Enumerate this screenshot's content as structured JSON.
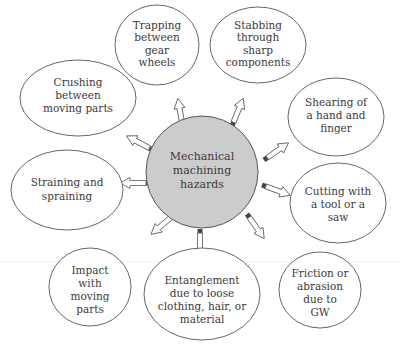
{
  "diagram": {
    "center": {
      "lines": [
        "Mechanical",
        "machining",
        "hazards"
      ]
    },
    "nodes": [
      {
        "id": "trapping",
        "lines": [
          "Trapping",
          "between",
          "gear",
          "wheels"
        ]
      },
      {
        "id": "stabbing",
        "lines": [
          "Stabbing",
          "through",
          "sharp",
          "components"
        ]
      },
      {
        "id": "crushing",
        "lines": [
          "Crushing",
          "between",
          "moving parts"
        ]
      },
      {
        "id": "shearing",
        "lines": [
          "Shearing of",
          "a hand and",
          "finger"
        ]
      },
      {
        "id": "straining",
        "lines": [
          "Straining and",
          "spraining"
        ]
      },
      {
        "id": "cutting",
        "lines": [
          "Cutting with",
          "a tool or a",
          "saw"
        ]
      },
      {
        "id": "impact",
        "lines": [
          "Impact",
          "with",
          "moving",
          "parts"
        ]
      },
      {
        "id": "entanglement",
        "lines": [
          "Entanglement",
          "due to loose",
          "clothing, hair, or",
          "material"
        ]
      },
      {
        "id": "friction",
        "lines": [
          "Friction or",
          "abrasion",
          "due to",
          "GW"
        ]
      }
    ],
    "colors": {
      "hub_fill": "#cccccc",
      "stroke": "#555555",
      "text": "#3a3a3a"
    }
  }
}
